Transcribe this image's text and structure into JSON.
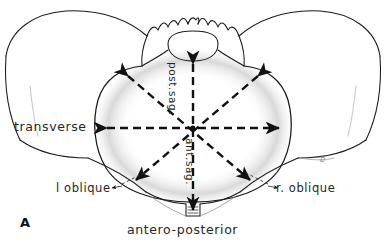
{
  "figure": {
    "panel_letter": "A",
    "background_color": "#ffffff",
    "ink_color": "#1a1a1a",
    "stipple_color": "#9a9a9a"
  },
  "labels": {
    "transverse": "transverse",
    "left_oblique": "l oblique",
    "right_oblique": "r. oblique",
    "antero_posterior": "antero-posterior",
    "posterior_sagittal": "post.sag.",
    "anterior_sagittal": "ant.sag.",
    "stray_mark": "b"
  },
  "diameters": [
    {
      "name": "transverse",
      "label": "transverse",
      "orientation": "horizontal",
      "arrowheads": "both",
      "style": "dashed"
    },
    {
      "name": "left-oblique",
      "label": "l oblique",
      "orientation": "diagonal-nw-se",
      "arrowheads": "both",
      "style": "dashed"
    },
    {
      "name": "right-oblique",
      "label": "r. oblique",
      "orientation": "diagonal-ne-sw",
      "arrowheads": "both",
      "style": "dashed"
    },
    {
      "name": "antero-posterior",
      "label": "antero-posterior",
      "orientation": "vertical",
      "arrowheads": "both",
      "style": "dashed",
      "segments": [
        {
          "name": "posterior-sagittal",
          "label": "post.sag."
        },
        {
          "name": "anterior-sagittal",
          "label": "ant.sag."
        }
      ]
    }
  ]
}
